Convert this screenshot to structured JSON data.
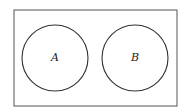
{
  "diagram": {
    "type": "venn",
    "universe": {
      "x": 14,
      "y": 10,
      "width": 163,
      "height": 96,
      "stroke": "#555555"
    },
    "sets": [
      {
        "label": "A",
        "cx": 55,
        "cy": 58,
        "r": 33,
        "stroke": "#333333"
      },
      {
        "label": "B",
        "cx": 135,
        "cy": 58,
        "r": 33,
        "stroke": "#333333"
      }
    ],
    "relationship": "disjoint"
  }
}
